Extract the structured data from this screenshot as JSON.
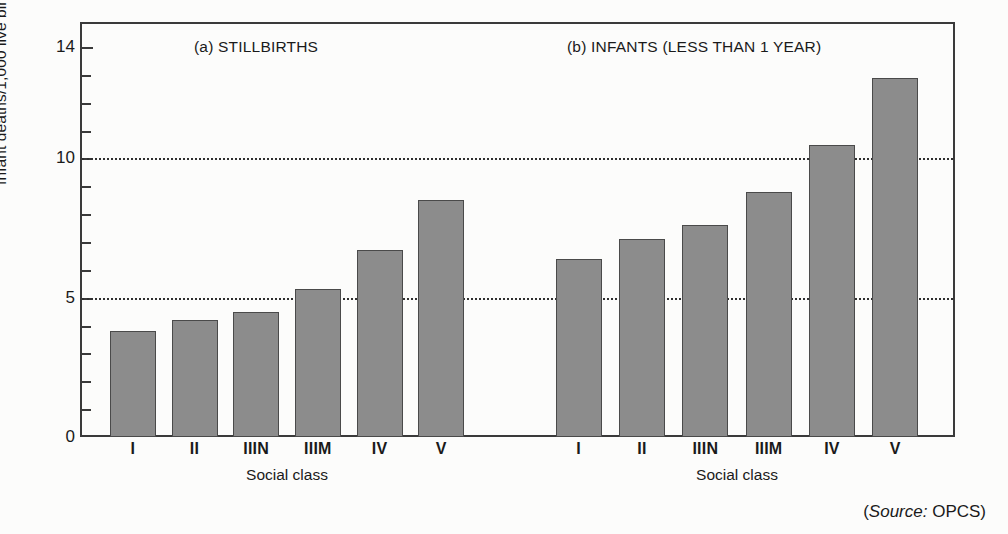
{
  "figure": {
    "source_note_prefix": "(",
    "source_word": "Source:",
    "source_value": " OPCS)"
  },
  "axis": {
    "y_title": "Infant deaths/1,000 live births",
    "x_title_a": "Social class",
    "x_title_b": "Social class",
    "y_tick_labels": [
      "0",
      "5",
      "10",
      "14"
    ],
    "y_tick_values": [
      0,
      5,
      10,
      14
    ],
    "y_minor_ticks": [
      1,
      2,
      3,
      4,
      6,
      7,
      8,
      9,
      11,
      12,
      13
    ],
    "gridline_values": [
      5,
      10
    ]
  },
  "chart_data": [
    {
      "type": "bar",
      "title": "(a) STILLBIRTHS",
      "panel": "a",
      "categories": [
        "I",
        "II",
        "IIIN",
        "IIIM",
        "IV",
        "V"
      ],
      "values": [
        3.8,
        4.2,
        4.5,
        5.3,
        6.7,
        8.5
      ],
      "xlabel": "Social class",
      "ylabel": "Infant deaths/1,000 live births",
      "ylim": [
        0,
        14.9
      ],
      "grid": true,
      "gridlines": [
        5,
        10
      ],
      "legend": "none",
      "bar_color": "#8c8c8c",
      "bar_border_color": "#4a4a4a"
    },
    {
      "type": "bar",
      "title": "(b) INFANTS (LESS THAN 1 YEAR)",
      "panel": "b",
      "categories": [
        "I",
        "II",
        "IIIN",
        "IIIM",
        "IV",
        "V"
      ],
      "values": [
        6.4,
        7.1,
        7.6,
        8.8,
        10.5,
        12.9
      ],
      "xlabel": "Social class",
      "ylabel": "Infant deaths/1,000 live births",
      "ylim": [
        0,
        14.9
      ],
      "grid": true,
      "gridlines": [
        5,
        10
      ],
      "legend": "none",
      "bar_color": "#8c8c8c",
      "bar_border_color": "#4a4a4a"
    }
  ]
}
